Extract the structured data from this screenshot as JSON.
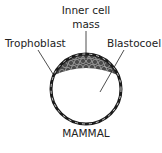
{
  "diagram": {
    "title": "MAMMAL",
    "labels": {
      "inner_cell_mass_line1": "Inner cell",
      "inner_cell_mass_line2": "mass",
      "trophoblast": "Trophoblast",
      "blastocoel": "Blastocoel"
    },
    "colors": {
      "outline": "#1a1a1a",
      "inner_cell_mass_fill": "#4a4a4a",
      "cell_outline": "#d0d0d0",
      "cavity": "#ffffff"
    }
  }
}
